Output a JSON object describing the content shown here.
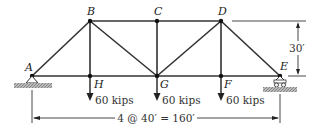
{
  "diagram": {
    "nodes": [
      {
        "id": "A",
        "label": "A",
        "x": 32,
        "y": 76
      },
      {
        "id": "B",
        "label": "B",
        "x": 90,
        "y": 21
      },
      {
        "id": "C",
        "label": "C",
        "x": 157,
        "y": 21
      },
      {
        "id": "D",
        "label": "D",
        "x": 221,
        "y": 21
      },
      {
        "id": "E",
        "label": "E",
        "x": 280,
        "y": 76
      },
      {
        "id": "H",
        "label": "H",
        "x": 90,
        "y": 76
      },
      {
        "id": "G",
        "label": "G",
        "x": 157,
        "y": 76
      },
      {
        "id": "F",
        "label": "F",
        "x": 221,
        "y": 76
      }
    ],
    "members": [
      "AB",
      "BC",
      "CD",
      "DE",
      "AH",
      "HG",
      "GF",
      "FE",
      "BH",
      "BG",
      "CG",
      "DG",
      "DF"
    ],
    "loads": [
      {
        "node": "H",
        "label": "60 kips"
      },
      {
        "node": "G",
        "label": "60 kips"
      },
      {
        "node": "F",
        "label": "60 kips"
      }
    ],
    "supports": {
      "left": "pin",
      "right": "roller"
    },
    "height_dim": "30′",
    "span_dim": "4 @ 40′ = 160′"
  }
}
